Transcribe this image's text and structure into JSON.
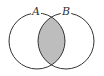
{
  "diagram": {
    "type": "venn",
    "sets": [
      {
        "label": "A",
        "cx": 37,
        "cy": 41,
        "r": 28
      },
      {
        "label": "B",
        "cx": 66,
        "cy": 41,
        "r": 28
      }
    ],
    "shaded_region": "A ∩ B",
    "colors": {
      "stroke": "#333333",
      "shade": "#bdbdbd",
      "background": "#ffffff"
    }
  }
}
